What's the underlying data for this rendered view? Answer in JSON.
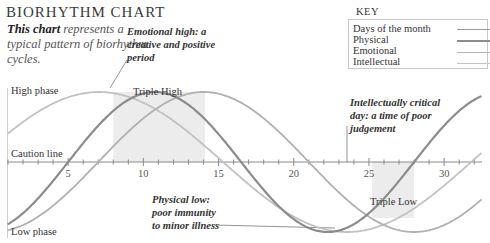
{
  "header": {
    "title": "BIORHYTHM CHART",
    "intro_bold": "This chart",
    "intro_rest": " represents a typical pattern of biorhythm cycles."
  },
  "key": {
    "title": "KEY",
    "items": [
      {
        "label": "Days of the month",
        "style": "ticked",
        "color": "#8a8a8a"
      },
      {
        "label": "Physical",
        "style": "solid",
        "color": "#8c8c8c"
      },
      {
        "label": "Emotional",
        "style": "solid",
        "color": "#b4b4b4"
      },
      {
        "label": "Intellectual",
        "style": "solid",
        "color": "#c4c4c4"
      }
    ]
  },
  "annotations": {
    "emotional_high": "Emotional high: a creative and positive period",
    "intellectual_critical": "Intellectually critical day: a time of poor judgement",
    "physical_low": "Physical low: poor immunity to minor illness",
    "triple_high": "Triple High",
    "triple_low": "Triple Low",
    "high_phase": "High phase",
    "caution_line": "Caution line",
    "low_phase": "Low phase"
  },
  "chart_data": {
    "type": "line",
    "title": "BIORHYTHM CHART",
    "xlabel": "Days of the month",
    "ylabel": "",
    "xlim": [
      1,
      32
    ],
    "ylim": [
      -1,
      1
    ],
    "x_ticks": [
      5,
      10,
      15,
      20,
      25,
      30
    ],
    "y_labels": {
      "1": "High phase",
      "0": "Caution line",
      "-1": "Low phase"
    },
    "series": [
      {
        "name": "Physical",
        "period": 23,
        "zero_cross_day": 5,
        "color": "#8c8c8c",
        "width": 2.2
      },
      {
        "name": "Emotional",
        "period": 28,
        "zero_cross_day": 7,
        "color": "#b0b0b0",
        "width": 1.8
      },
      {
        "name": "Intellectual",
        "period": 33,
        "zero_cross_day": -1.2,
        "color": "#c2c2c2",
        "width": 1.8
      }
    ],
    "regions": [
      {
        "label": "Triple High",
        "x_start": 8.0,
        "x_end": 14.1,
        "y_start": 0,
        "y_end": 1
      },
      {
        "label": "Triple Low",
        "x_start": 25.2,
        "x_end": 28.0,
        "y_start": -0.8,
        "y_end": 0
      }
    ],
    "grid": false,
    "legend_position": "top-right"
  }
}
